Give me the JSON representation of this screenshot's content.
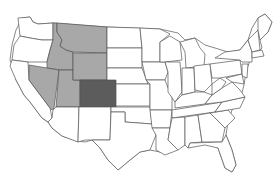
{
  "map": {
    "title": "",
    "region": "United States",
    "colors": {
      "default": "#ffffff",
      "light": "#a8a8a8",
      "dark": "#5c5c5c",
      "stroke": "#555555"
    },
    "highlighted_states": [
      {
        "name": "Montana",
        "shade": "light"
      },
      {
        "name": "Idaho",
        "shade": "light"
      },
      {
        "name": "Wyoming",
        "shade": "light"
      },
      {
        "name": "Nevada",
        "shade": "light"
      },
      {
        "name": "Utah",
        "shade": "light"
      },
      {
        "name": "Colorado",
        "shade": "dark"
      }
    ]
  }
}
